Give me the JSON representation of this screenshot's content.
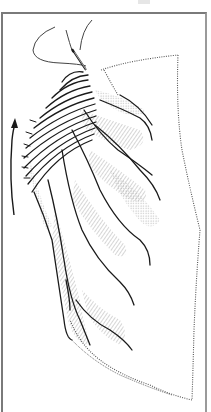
{
  "figure": {
    "colors": {
      "ink": "#1a1a1a",
      "stipple": "#6a6a6a",
      "frame": "#7a7a7a",
      "background": "#ffffff"
    },
    "elements": {
      "needle": "needle",
      "thread": "thread",
      "arrow": "direction-arrow",
      "fabric": "gathered-fabric",
      "outline": "fabric-dotted-outline"
    }
  }
}
